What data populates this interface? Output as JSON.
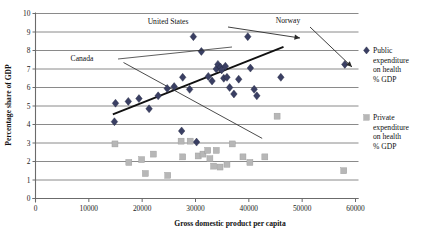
{
  "chart_data": {
    "type": "scatter",
    "title": "",
    "xlabel": "Gross domestic product per capita",
    "ylabel": "Percentage share of GDP",
    "xlim": [
      0,
      60000
    ],
    "ylim": [
      0,
      10
    ],
    "xticks": [
      "0",
      "10000",
      "20000",
      "30000",
      "40000",
      "50000",
      "60000"
    ],
    "yticks": [
      "0",
      "1",
      "2",
      "3",
      "4",
      "5",
      "6",
      "7",
      "8",
      "9",
      "10"
    ],
    "grid": "horizontal",
    "legend_position": "right",
    "series": [
      {
        "name": "Public expenditure on health % GDP",
        "marker": "diamond",
        "color": "#3a3f63",
        "points": [
          [
            14800,
            4.15
          ],
          [
            15000,
            5.15
          ],
          [
            17400,
            5.25
          ],
          [
            19400,
            5.4
          ],
          [
            21300,
            4.85
          ],
          [
            23000,
            5.55
          ],
          [
            24700,
            5.95
          ],
          [
            26000,
            6.05
          ],
          [
            27400,
            3.65
          ],
          [
            27600,
            6.55
          ],
          [
            28900,
            5.9
          ],
          [
            29600,
            8.75
          ],
          [
            30200,
            3.05
          ],
          [
            31100,
            7.95
          ],
          [
            32400,
            6.6
          ],
          [
            33100,
            6.35
          ],
          [
            33900,
            7.0
          ],
          [
            34200,
            7.25
          ],
          [
            34700,
            7.1
          ],
          [
            34900,
            6.95
          ],
          [
            35300,
            6.5
          ],
          [
            35600,
            7.15
          ],
          [
            35900,
            6.55
          ],
          [
            36400,
            6.0
          ],
          [
            37200,
            5.65
          ],
          [
            38100,
            6.45
          ],
          [
            39800,
            8.75
          ],
          [
            40300,
            7.05
          ],
          [
            41000,
            5.9
          ],
          [
            41500,
            5.55
          ],
          [
            46000,
            6.55
          ],
          [
            58000,
            7.25
          ]
        ]
      },
      {
        "name": "Private expenditure on health % GDP",
        "marker": "square",
        "color": "#b7b7b7",
        "points": [
          [
            14900,
            2.95
          ],
          [
            17500,
            1.95
          ],
          [
            19900,
            2.1
          ],
          [
            20600,
            1.35
          ],
          [
            22100,
            2.4
          ],
          [
            24800,
            1.25
          ],
          [
            27300,
            3.1
          ],
          [
            27600,
            2.25
          ],
          [
            29000,
            3.1
          ],
          [
            30500,
            2.3
          ],
          [
            31400,
            2.4
          ],
          [
            32300,
            2.6
          ],
          [
            32700,
            2.15
          ],
          [
            33400,
            1.75
          ],
          [
            33900,
            2.6
          ],
          [
            34600,
            1.7
          ],
          [
            35900,
            1.85
          ],
          [
            36900,
            2.95
          ],
          [
            38900,
            2.25
          ],
          [
            40200,
            1.95
          ],
          [
            43000,
            2.25
          ],
          [
            45300,
            4.45
          ],
          [
            57800,
            1.5
          ]
        ]
      }
    ],
    "trend_lines": [
      {
        "name": "rising-trend",
        "from": [
          14500,
          4.55
        ],
        "to": [
          46500,
          8.2
        ],
        "style": "thick"
      },
      {
        "name": "falling-trend",
        "from": [
          16500,
          7.35
        ],
        "to": [
          42500,
          3.25
        ],
        "style": "thin"
      }
    ],
    "annotations": [
      {
        "label": "United States",
        "text_x": 168,
        "text_y": 24,
        "leader_from": [
          228,
          27
        ],
        "leader_to": [
          300,
          38
        ],
        "arrow": true
      },
      {
        "label": "Canada",
        "text_x": 82,
        "text_y": 61,
        "leader_from": [
          118,
          59
        ],
        "leader_to": [
          232,
          47
        ],
        "arrow": false
      },
      {
        "label": "Norway",
        "text_x": 288,
        "text_y": 23,
        "leader_from": [
          310,
          27
        ],
        "leader_to": [
          352,
          67
        ],
        "arrow": true
      }
    ]
  },
  "legend": {
    "items": [
      {
        "marker": "diamond",
        "color": "#3a3f63",
        "lines": [
          "Public",
          "expenditure",
          "on health",
          "% GDP"
        ]
      },
      {
        "marker": "square",
        "color": "#b7b7b7",
        "lines": [
          "Private",
          "expenditure",
          "on health",
          "% GDP"
        ]
      }
    ]
  }
}
